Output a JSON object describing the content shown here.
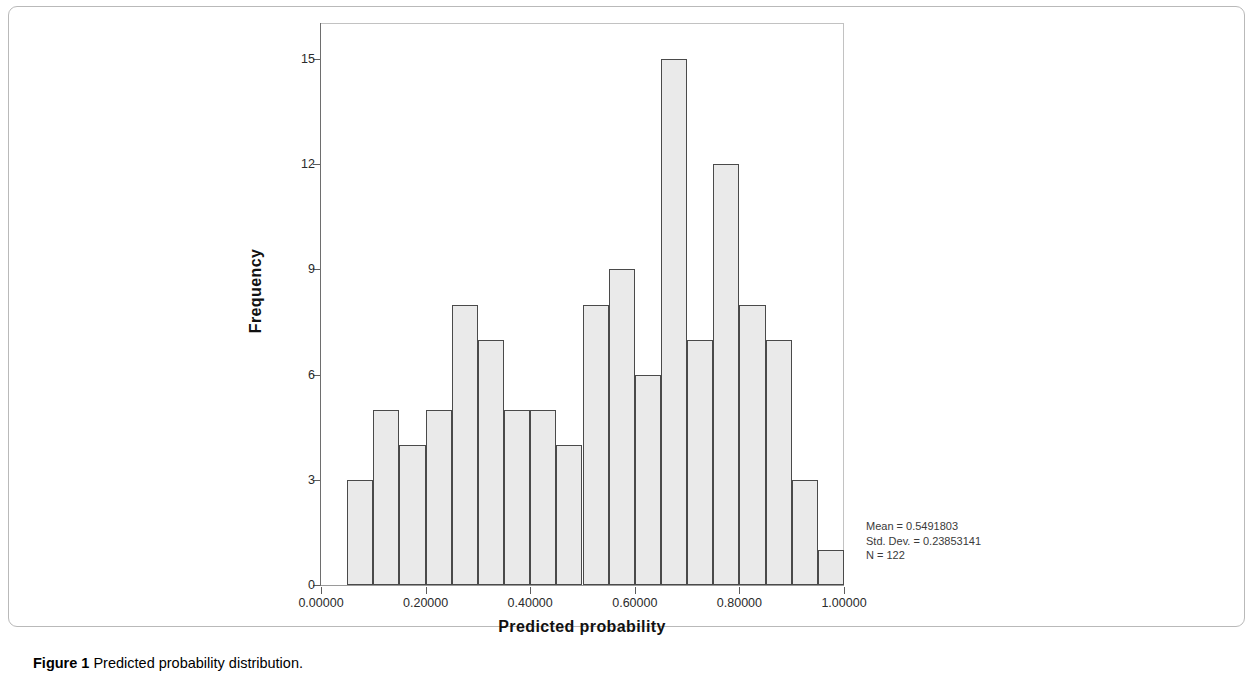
{
  "figure": {
    "caption_label": "Figure 1",
    "caption_text": "Predicted probability distribution."
  },
  "annotation": {
    "mean": "Mean = 0.5491803",
    "std_dev": "Std. Dev. = 0.23853141",
    "n": "N = 122"
  },
  "chart_data": {
    "type": "bar",
    "title": "",
    "subtitle": "",
    "xlabel": "Predicted probability",
    "ylabel": "Frequency",
    "xlim": [
      0.0,
      1.0
    ],
    "ylim": [
      0,
      16
    ],
    "grid": false,
    "legend": null,
    "bin_width": 0.05,
    "bin_starts": [
      0.05,
      0.1,
      0.15,
      0.2,
      0.25,
      0.3,
      0.35,
      0.4,
      0.45,
      0.5,
      0.55,
      0.6,
      0.65,
      0.7,
      0.75,
      0.8,
      0.85,
      0.9,
      0.95
    ],
    "categories": [
      "0.05-0.10",
      "0.10-0.15",
      "0.15-0.20",
      "0.20-0.25",
      "0.25-0.30",
      "0.30-0.35",
      "0.35-0.40",
      "0.40-0.45",
      "0.45-0.50",
      "0.50-0.55",
      "0.55-0.60",
      "0.60-0.65",
      "0.65-0.70",
      "0.70-0.75",
      "0.75-0.80",
      "0.80-0.85",
      "0.85-0.90",
      "0.90-0.95",
      "0.95-1.00"
    ],
    "values": [
      3,
      5,
      4,
      5,
      8,
      7,
      5,
      5,
      4,
      8,
      9,
      6,
      15,
      7,
      12,
      8,
      7,
      3,
      1
    ],
    "x_ticks": [
      0.0,
      0.2,
      0.4,
      0.6,
      0.8,
      1.0
    ],
    "x_tick_labels": [
      "0.00000",
      "0.20000",
      "0.40000",
      "0.60000",
      "0.80000",
      "1.00000"
    ],
    "y_ticks": [
      0,
      3,
      6,
      9,
      12,
      15
    ],
    "y_tick_labels": [
      "0",
      "3",
      "6",
      "9",
      "12",
      "15"
    ],
    "statistics": {
      "mean": 0.5491803,
      "std_dev": 0.23853141,
      "n": 122
    },
    "colors": {
      "bar_fill": "#eaeaea",
      "bar_border": "#4a4a4a",
      "axis": "#5d5d5d",
      "frame": "#c2c2c2",
      "text": "#111111"
    }
  }
}
